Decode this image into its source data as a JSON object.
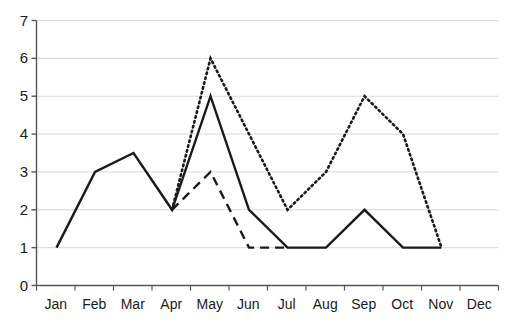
{
  "chart_data": {
    "type": "line",
    "title": "",
    "xlabel": "",
    "ylabel": "",
    "categories": [
      "Jan",
      "Feb",
      "Mar",
      "Apr",
      "May",
      "Jun",
      "Jul",
      "Aug",
      "Sep",
      "Oct",
      "Nov",
      "Dec"
    ],
    "ylim": [
      0,
      7
    ],
    "yticks": [
      0,
      1,
      2,
      3,
      4,
      5,
      6,
      7
    ],
    "grid": "horizontal",
    "legend": "none",
    "series": [
      {
        "name": "solid-series",
        "style": "solid",
        "color": "#1a1a1a",
        "x": [
          "Jan",
          "Feb",
          "Mar",
          "Apr",
          "May",
          "Jun",
          "Jul",
          "Aug",
          "Sep",
          "Oct",
          "Nov"
        ],
        "values": [
          1,
          3,
          3.5,
          2,
          5,
          2,
          1,
          1,
          2,
          1,
          1
        ]
      },
      {
        "name": "dotted-series",
        "style": "dotted",
        "color": "#1a1a1a",
        "x": [
          "Apr",
          "May",
          "Jun",
          "Jul",
          "Aug",
          "Sep",
          "Oct",
          "Nov"
        ],
        "values": [
          2,
          6,
          4,
          2,
          3,
          5,
          4,
          1
        ]
      },
      {
        "name": "dashed-series",
        "style": "dashed",
        "color": "#1a1a1a",
        "x": [
          "Apr",
          "May",
          "Jun",
          "Jul"
        ],
        "values": [
          2,
          3,
          1,
          1
        ]
      }
    ]
  },
  "axis": {
    "y_labels": [
      "7",
      "6",
      "5",
      "4",
      "3",
      "2",
      "1",
      "0"
    ],
    "x_labels": [
      "Jan",
      "Feb",
      "Mar",
      "Apr",
      "May",
      "Jun",
      "Jul",
      "Aug",
      "Sep",
      "Oct",
      "Nov",
      "Dec"
    ]
  },
  "colors": {
    "line": "#1a1a1a",
    "grid": "#d9d9d9",
    "axis": "#555555",
    "background": "#ffffff"
  }
}
